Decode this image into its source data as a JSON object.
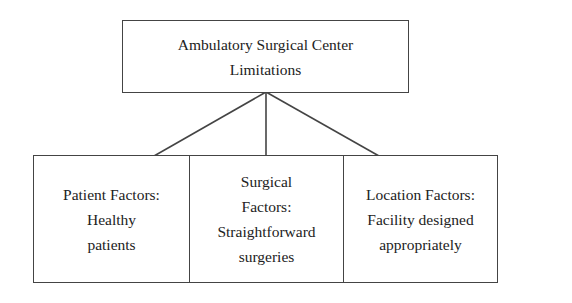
{
  "root": {
    "lines": [
      "Ambulatory Surgical Center",
      "Limitations"
    ]
  },
  "children": [
    {
      "lines": [
        "Patient Factors:",
        "Healthy",
        "patients"
      ]
    },
    {
      "lines": [
        "Surgical",
        "Factors:",
        "Straightforward",
        "surgeries"
      ]
    },
    {
      "lines": [
        "Location Factors:",
        "Facility designed",
        "appropriately"
      ]
    }
  ],
  "colors": {
    "line": "#444444",
    "text": "#222222",
    "background": "#ffffff"
  }
}
